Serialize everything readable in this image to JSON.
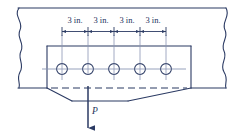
{
  "figure": {
    "name": "bolted-plate-block-shear-diagram",
    "colors": {
      "line": "#2b3a63",
      "centerline": "#7b87a8",
      "hole_stroke": "#2b3a63",
      "background": "#ffffff",
      "text": "#22335c"
    },
    "dimensions": {
      "unit": "in.",
      "labels": [
        "3 in.",
        "3 in.",
        "3 in.",
        "3 in."
      ],
      "spacing_value": 3,
      "count": 4
    },
    "holes": {
      "count": 5,
      "centers_px": [
        62,
        88,
        114,
        140,
        166
      ],
      "center_y_px": 69,
      "radius_px": 5.4
    },
    "load": {
      "label": "P",
      "direction": "down",
      "x_px": 88
    },
    "plate": {
      "left_px": 47,
      "right_px": 191,
      "top_px": 46,
      "bottom_px": 88
    },
    "break_lines": {
      "left": "wavy-break-line",
      "right": "wavy-break-line"
    },
    "tearout": {
      "type": "dashed-block-shear-path",
      "apex_left_px": 72,
      "apex_right_px": 128,
      "apex_y_px": 101
    }
  }
}
